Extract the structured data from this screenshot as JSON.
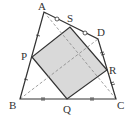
{
  "diagram": {
    "points": {
      "A": {
        "label": "A",
        "x": 44,
        "y": 12
      },
      "B": {
        "label": "B",
        "x": 20,
        "y": 99
      },
      "C": {
        "label": "C",
        "x": 116,
        "y": 99
      },
      "D": {
        "label": "D",
        "x": 98,
        "y": 39
      },
      "P": {
        "label": "P",
        "x": 32,
        "y": 57
      },
      "Q": {
        "label": "Q",
        "x": 67,
        "y": 99
      },
      "R": {
        "label": "R",
        "x": 107,
        "y": 70
      },
      "S": {
        "label": "S",
        "x": 70,
        "y": 27
      }
    },
    "segments": {
      "outer": [
        "AB",
        "BC",
        "CD",
        "DA"
      ],
      "square": [
        "PQ",
        "QR",
        "RS",
        "SP"
      ],
      "diagonals_dashed": [
        "AC",
        "BD"
      ]
    },
    "tick_marks": {
      "AB": "single tick on AP and PB",
      "BC": "double tick on BQ and QC",
      "CD": "double tick on CR and RD",
      "DA": "circle mark on AS and SD"
    },
    "colors": {
      "line": "#333333",
      "fill": "#d9d9d9",
      "dashed": "#888888"
    }
  }
}
